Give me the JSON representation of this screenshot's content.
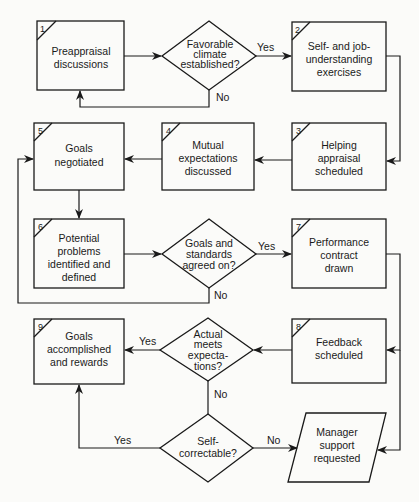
{
  "diagram": {
    "type": "flowchart",
    "nodes": {
      "n1": {
        "number": "1",
        "lines": [
          "Preappraisal",
          "discussions"
        ]
      },
      "d1": {
        "lines": [
          "Favorable",
          "climate",
          "established?"
        ]
      },
      "n2": {
        "number": "2",
        "lines": [
          "Self- and job-",
          "understanding",
          "exercises"
        ]
      },
      "n3": {
        "number": "3",
        "lines": [
          "Helping",
          "appraisal",
          "scheduled"
        ]
      },
      "n4": {
        "number": "4",
        "lines": [
          "Mutual",
          "expectations",
          "discussed"
        ]
      },
      "n5": {
        "number": "5",
        "lines": [
          "Goals",
          "negotiated"
        ]
      },
      "n6": {
        "number": "6",
        "lines": [
          "Potential",
          "problems",
          "identified and",
          "defined"
        ]
      },
      "d2": {
        "lines": [
          "Goals and",
          "standards",
          "agreed on?"
        ]
      },
      "n7": {
        "number": "7",
        "lines": [
          "Performance",
          "contract",
          "drawn"
        ]
      },
      "n8": {
        "number": "8",
        "lines": [
          "Feedback",
          "scheduled"
        ]
      },
      "d3": {
        "lines": [
          "Actual",
          "meets",
          "expecta-",
          "tions?"
        ]
      },
      "n9": {
        "number": "9",
        "lines": [
          "Goals",
          "accomplished",
          "and rewards"
        ]
      },
      "d4": {
        "lines": [
          "Self-",
          "correctable?"
        ]
      },
      "p1": {
        "lines": [
          "Manager",
          "support",
          "requested"
        ]
      }
    },
    "edge_labels": {
      "d1_yes": "Yes",
      "d1_no": "No",
      "d2_yes": "Yes",
      "d2_no": "No",
      "d3_yes": "Yes",
      "d3_no": "No",
      "d4_yes": "Yes",
      "d4_no": "No"
    }
  }
}
